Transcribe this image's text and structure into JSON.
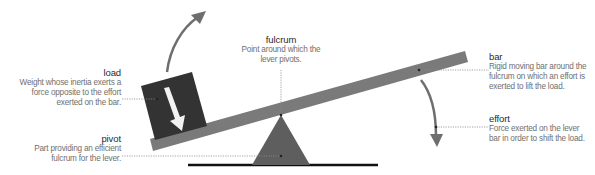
{
  "colors": {
    "bar": "#7a7a7a",
    "load_box": "#333333",
    "fulcrum": "#5e5e5e",
    "ground": "#111111",
    "arrow": "#6e6e6e",
    "leader": "#8a8a8a"
  },
  "labels": {
    "load": {
      "title": "load",
      "description": "Weight whose inertia exerts a force opposite to the effort exerted on the bar."
    },
    "pivot": {
      "title": "pivot",
      "description": "Part providing an efficient fulcrum for the lever."
    },
    "fulcrum": {
      "title": "fulcrum",
      "description": "Point around which the lever pivots."
    },
    "bar": {
      "title": "bar",
      "description": "Rigid moving bar around the fulcrum on which an effort is exerted to lift the load."
    },
    "effort": {
      "title": "effort",
      "description": "Force exerted on the lever bar in order to shift the load."
    }
  },
  "icons": {
    "load_arrow": "curved-arrow-up-icon",
    "effort_arrow": "curved-arrow-down-icon",
    "weight_arrow": "down-arrow-icon"
  }
}
